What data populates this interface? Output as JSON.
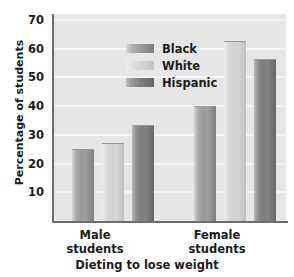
{
  "chart_data": {
    "type": "bar",
    "title": "",
    "xlabel": "Dieting to lose weight",
    "ylabel": "Percentage of students",
    "categories": [
      "Male students",
      "Female students"
    ],
    "category_lines": [
      [
        "Male",
        "students"
      ],
      [
        "Female",
        "students"
      ]
    ],
    "series": [
      {
        "name": "Black",
        "values": [
          25,
          40
        ]
      },
      {
        "name": "White",
        "values": [
          27,
          62.5
        ]
      },
      {
        "name": "Hispanic",
        "values": [
          33.5,
          56.5
        ]
      }
    ],
    "ylim": [
      0,
      72
    ],
    "yticks": [
      10,
      20,
      30,
      40,
      50,
      60,
      70
    ],
    "ytick_labels": [
      "10",
      "20",
      "30",
      "40",
      "50",
      "60",
      "70"
    ],
    "grid": true,
    "grid_color": "#f4f4f4",
    "legend_position": "upper left",
    "plot_background": "#e6e6e6",
    "axis_color": "#6d6d6d",
    "series_colors": [
      "#9a9a9a",
      "#d6d6d6",
      "#7d7d7d"
    ]
  }
}
